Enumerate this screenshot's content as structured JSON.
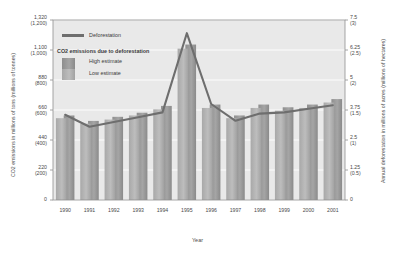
{
  "chart_data": {
    "type": "bar",
    "title": "",
    "subtitle": "",
    "xlabel": "Year",
    "ylabel_left": "CO2 emissions in millions of tons (millions of tonnes)",
    "ylabel_right": "Annual deforestation in millions of acres (millions of hectares)",
    "categories": [
      "1990",
      "1991",
      "1992",
      "1993",
      "1994",
      "1995",
      "1996",
      "1997",
      "1998",
      "1999",
      "2000",
      "2001"
    ],
    "left_axis": {
      "ticks": [
        {
          "major": "1,320",
          "minor": "(1,200)",
          "value": 1320
        },
        {
          "major": "1,100",
          "minor": "(1,000)",
          "value": 1100
        },
        {
          "major": "880",
          "minor": "(800)",
          "value": 880
        },
        {
          "major": "660",
          "minor": "(600)",
          "value": 660
        },
        {
          "major": "440",
          "minor": "(400)",
          "value": 440
        },
        {
          "major": "220",
          "minor": "(200)",
          "value": 220
        },
        {
          "major": "0",
          "minor": "",
          "value": 0
        }
      ],
      "min": 0,
      "max": 1320,
      "grid": true
    },
    "right_axis": {
      "ticks": [
        {
          "major": "7.5",
          "minor": "(3)",
          "value": 7.5
        },
        {
          "major": "6.25",
          "minor": "(2.5)",
          "value": 6.25
        },
        {
          "major": "5",
          "minor": "(2)",
          "value": 5
        },
        {
          "major": "3.75",
          "minor": "(1.5)",
          "value": 3.75
        },
        {
          "major": "2.5",
          "minor": "(1)",
          "value": 2.5
        },
        {
          "major": "1.25",
          "minor": "(0.5)",
          "value": 1.25
        },
        {
          "major": "0",
          "minor": "",
          "value": 0
        }
      ],
      "min": 0,
      "max": 7.5,
      "grid": false
    },
    "series": [
      {
        "name": "High estimate",
        "type": "bar",
        "axis": "left",
        "color": "#9a9a9a",
        "values": [
          620,
          580,
          610,
          640,
          690,
          1140,
          700,
          620,
          700,
          680,
          700,
          740
        ]
      },
      {
        "name": "Low estimate",
        "type": "bar",
        "axis": "left",
        "color": "#b4b4b4",
        "values": [
          600,
          560,
          590,
          620,
          665,
          1110,
          675,
          600,
          675,
          655,
          675,
          715
        ]
      },
      {
        "name": "Deforestation",
        "type": "line",
        "axis": "right",
        "color": "#6e6e6e",
        "values": [
          3.55,
          3.05,
          3.25,
          3.45,
          3.65,
          6.95,
          4.0,
          3.3,
          3.6,
          3.65,
          3.8,
          3.95
        ]
      }
    ],
    "legend": {
      "position": "top-left",
      "entries": [
        {
          "label": "Deforestation",
          "marker": "line",
          "color": "#6e6e6e"
        },
        {
          "label": "CO2 emissions due to deforestation",
          "marker": "none",
          "color": "#3b3b3b"
        },
        {
          "label": "High estimate",
          "marker": "bar-dark",
          "color": "#9a9a9a"
        },
        {
          "label": "Low estimate",
          "marker": "bar-light",
          "color": "#b4b4b4"
        }
      ]
    },
    "plot_background": "#e9e9e9",
    "grid_color": "#ffffff",
    "border_color": "#8f8f8f"
  }
}
